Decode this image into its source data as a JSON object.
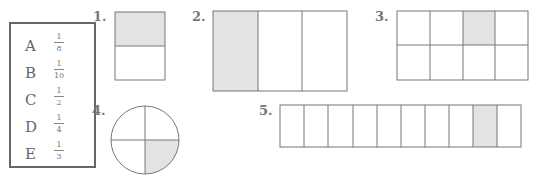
{
  "legend": {
    "items": [
      {
        "letter": "A",
        "num": "1",
        "den": "8"
      },
      {
        "letter": "B",
        "num": "1",
        "den": "10"
      },
      {
        "letter": "C",
        "num": "1",
        "den": "2"
      },
      {
        "letter": "D",
        "num": "1",
        "den": "4"
      },
      {
        "letter": "E",
        "num": "1",
        "den": "3"
      }
    ]
  },
  "figures": [
    {
      "label": "1.",
      "shape": "rectangle",
      "parts": 2,
      "shaded": 1,
      "shaded_index": 0,
      "orientation": "horizontal"
    },
    {
      "label": "2.",
      "shape": "rectangle",
      "parts": 3,
      "shaded": 1,
      "shaded_index": 0,
      "orientation": "vertical"
    },
    {
      "label": "3.",
      "shape": "grid",
      "rows": 2,
      "cols": 4,
      "shaded": 1,
      "shaded_cell": [
        0,
        2
      ]
    },
    {
      "label": "4.",
      "shape": "circle",
      "parts": 4,
      "shaded": 1,
      "shaded_quadrant": "bottom-right"
    },
    {
      "label": "5.",
      "shape": "rectangle",
      "parts": 10,
      "shaded": 1,
      "shaded_index": 8,
      "orientation": "vertical"
    }
  ],
  "colors": {
    "shade": "#e3e3e3",
    "stroke": "#777777"
  }
}
